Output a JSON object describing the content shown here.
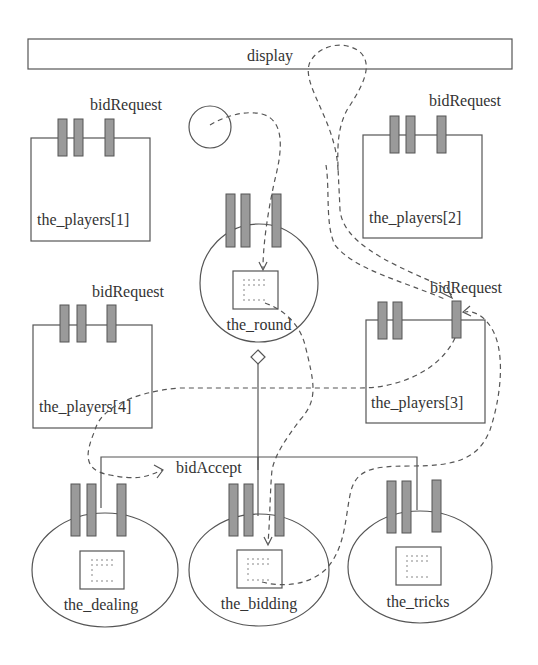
{
  "diagram": {
    "display": {
      "label": "display"
    },
    "players": [
      {
        "label": "the_players[1]",
        "port_label": "bidRequest"
      },
      {
        "label": "the_players[2]",
        "port_label": "bidRequest"
      },
      {
        "label": "the_players[3]",
        "port_label": "bidRequest"
      },
      {
        "label": "the_players[4]",
        "port_label": "bidRequest"
      }
    ],
    "round": {
      "label": "the_round"
    },
    "subtasks": [
      {
        "label": "the_dealing"
      },
      {
        "label": "the_bidding"
      },
      {
        "label": "the_tricks"
      }
    ],
    "connector_label": "bidAccept",
    "colors": {
      "stroke": "#555555",
      "port_fill": "#9a9a9a",
      "text": "#333333"
    }
  }
}
